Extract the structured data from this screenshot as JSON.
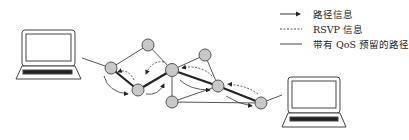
{
  "legend": [
    {
      "label": "路径信息",
      "style": "arrow"
    },
    {
      "label": "RSVP 信息",
      "style": "dashed"
    },
    {
      "label": "带有 QoS 预留的路径",
      "style": "solid"
    }
  ],
  "colors": {
    "node_fill": "#c8c8c8",
    "node_stroke": "#555555",
    "line": "#444444",
    "reserved_path": "#222222"
  },
  "nodes": [
    {
      "id": "A",
      "x": 111,
      "y": 68
    },
    {
      "id": "B",
      "x": 148,
      "y": 45
    },
    {
      "id": "C",
      "x": 138,
      "y": 90
    },
    {
      "id": "D",
      "x": 172,
      "y": 70
    },
    {
      "id": "E",
      "x": 172,
      "y": 102
    },
    {
      "id": "F",
      "x": 205,
      "y": 55
    },
    {
      "id": "G",
      "x": 218,
      "y": 86
    },
    {
      "id": "H",
      "x": 261,
      "y": 103
    }
  ],
  "hosts": [
    {
      "id": "sender-laptop",
      "x": 15,
      "y": 30
    },
    {
      "id": "receiver-laptop",
      "x": 282,
      "y": 77
    }
  ]
}
